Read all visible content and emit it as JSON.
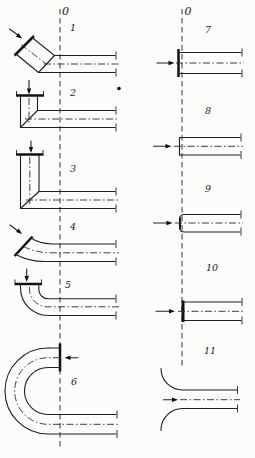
{
  "figure": {
    "left_column": {
      "axis_label": "0",
      "items": [
        {
          "number": "1",
          "name": "oblique-sharp-edged-inlet-with-mitre-bend"
        },
        {
          "number": "2",
          "name": "short-vertical-inlet-sharp-90-elbow"
        },
        {
          "number": "3",
          "name": "long-vertical-inlet-sharp-90-elbow"
        },
        {
          "number": "4",
          "name": "oblique-inlet-smooth-bend"
        },
        {
          "number": "5",
          "name": "vertical-inlet-rounded-90-elbow"
        },
        {
          "number": "6",
          "name": "u-shaped-180-degree-bend-inlet"
        }
      ]
    },
    "right_column": {
      "axis_label": "0",
      "items": [
        {
          "number": "7",
          "name": "sharp-edged-inlet-in-end-wall"
        },
        {
          "number": "8",
          "name": "flush-thin-walled-inlet"
        },
        {
          "number": "9",
          "name": "rounded-edge-inlet"
        },
        {
          "number": "10",
          "name": "thick-walled-inlet"
        },
        {
          "number": "11",
          "name": "bellmouth-trumpet-inlet"
        }
      ]
    }
  }
}
